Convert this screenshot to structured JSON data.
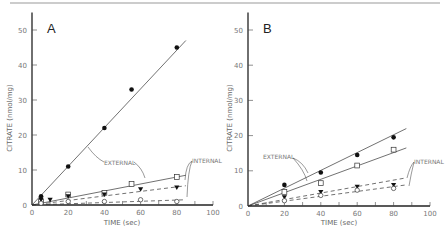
{
  "chart_data": [
    {
      "type": "scatter",
      "panel": "A",
      "xlabel": "TIME (sec)",
      "ylabel": "CITRATE (nmol/mg)",
      "xlim": [
        0,
        100
      ],
      "ylim": [
        0,
        55
      ],
      "xticks": [
        0,
        20,
        40,
        60,
        80,
        100
      ],
      "yticks": [
        0,
        10,
        20,
        30,
        40,
        50
      ],
      "grid": false,
      "annotations": [
        "EXTERNAL",
        "INTERNAL"
      ],
      "series": [
        {
          "name": "external-filled-circle",
          "marker": "filled-circle",
          "line": "solid",
          "x": [
            5,
            20,
            40,
            55,
            80
          ],
          "y": [
            2.5,
            11,
            22,
            33,
            45
          ],
          "fit_end": [
            85,
            47
          ]
        },
        {
          "name": "external-open-square",
          "marker": "open-square",
          "line": "solid",
          "x": [
            5,
            20,
            40,
            55,
            80
          ],
          "y": [
            1,
            3,
            3.5,
            6,
            8
          ],
          "fit_end": [
            85,
            8.5
          ]
        },
        {
          "name": "internal-filled-triangle",
          "marker": "filled-triangle",
          "line": "dashed",
          "x": [
            5,
            10,
            20,
            40,
            60,
            80
          ],
          "y": [
            1.5,
            1.5,
            2.5,
            3,
            4.5,
            5
          ],
          "fit_end": [
            85,
            5.5
          ]
        },
        {
          "name": "internal-open-circle",
          "marker": "open-circle",
          "line": "dashed",
          "x": [
            5,
            20,
            40,
            60,
            80
          ],
          "y": [
            0.5,
            1,
            1,
            1.5,
            1
          ],
          "fit_end": [
            85,
            1.5
          ]
        }
      ]
    },
    {
      "type": "scatter",
      "panel": "B",
      "xlabel": "TIME (sec)",
      "ylabel": "CITRATE (nmol/mg)",
      "xlim": [
        0,
        100
      ],
      "ylim": [
        0,
        55
      ],
      "xticks": [
        0,
        20,
        40,
        60,
        80,
        100
      ],
      "yticks": [
        0,
        10,
        20,
        30,
        40,
        50
      ],
      "grid": false,
      "annotations": [
        "EXTERNAL",
        "INTERNAL"
      ],
      "series": [
        {
          "name": "external-filled-circle",
          "marker": "filled-circle",
          "line": "solid",
          "x": [
            20,
            40,
            60,
            80
          ],
          "y": [
            6,
            9.5,
            14.5,
            19.5
          ],
          "fit_end": [
            87,
            22
          ]
        },
        {
          "name": "external-open-square",
          "marker": "open-square",
          "line": "solid",
          "x": [
            20,
            40,
            60,
            80
          ],
          "y": [
            4,
            6.5,
            11.5,
            16
          ],
          "fit_end": [
            87,
            16.5
          ]
        },
        {
          "name": "internal-filled-triangle",
          "marker": "filled-triangle",
          "line": "dashed",
          "x": [
            20,
            40,
            60,
            80
          ],
          "y": [
            2.5,
            4,
            5.5,
            6
          ],
          "fit_end": [
            87,
            8
          ]
        },
        {
          "name": "internal-open-circle",
          "marker": "open-circle",
          "line": "dashed",
          "x": [
            20,
            40,
            60,
            80
          ],
          "y": [
            1.5,
            3,
            4.5,
            5
          ],
          "fit_end": [
            87,
            6
          ]
        }
      ]
    }
  ],
  "panels": {
    "a": {
      "label": "A",
      "xlabel": "TIME (sec)",
      "ylabel": "CITRATE (nmol/mg)",
      "external_label": "EXTERNAL",
      "internal_label": "INTERNAL"
    },
    "b": {
      "label": "B",
      "xlabel": "TIME (sec)",
      "ylabel": "CITRATE (nmol/mg)",
      "external_label": "EXTERNAL",
      "internal_label": "INTERNAL"
    }
  },
  "ticks": {
    "x": [
      "0",
      "20",
      "40",
      "60",
      "80",
      "100"
    ],
    "y": [
      "0",
      "10",
      "20",
      "30",
      "40",
      "50"
    ]
  }
}
